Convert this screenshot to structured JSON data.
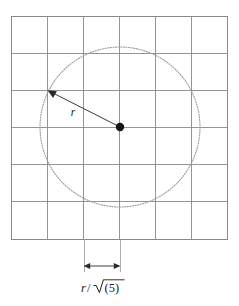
{
  "figure": {
    "background_color": "#ffffff",
    "grid": {
      "name": "square-grid",
      "columns": 6,
      "rows": 6,
      "left": 11,
      "top": 16,
      "right": 227,
      "bottom": 239,
      "cell_width": 36,
      "cell_height": 37.17,
      "line_color": "#8a8a8a",
      "x_positions": [
        11,
        47,
        83,
        119,
        155,
        191,
        227
      ],
      "y_positions": [
        16,
        53.2,
        90.3,
        127.5,
        164.7,
        201.8,
        239
      ]
    },
    "circle": {
      "name": "dotted-circle",
      "center_x": 120,
      "center_y": 127,
      "radius": 80,
      "stroke_color": "#9a9a9a",
      "style": "dotted"
    },
    "center_point": {
      "name": "circle-center-dot",
      "x": 120,
      "y": 127,
      "radius": 4.2,
      "color": "#141414"
    },
    "radius_arrow": {
      "name": "radius-arrow",
      "from_x": 120,
      "from_y": 127,
      "to_x": 49,
      "to_y": 91,
      "color": "#3a3a3a",
      "label": "r",
      "label_x": 73,
      "label_y": 116
    },
    "dimension": {
      "name": "cell-width-dimension",
      "left_x": 84,
      "right_x": 120,
      "line_y": 266,
      "ext_top_y": 239,
      "ext_bottom_y": 272,
      "label": "r/√(5)",
      "label_numerator": "r",
      "label_slash": "/",
      "label_radical_operand": "(5)",
      "label_x": 102,
      "label_y": 291,
      "color": "#3a3a3a"
    }
  }
}
